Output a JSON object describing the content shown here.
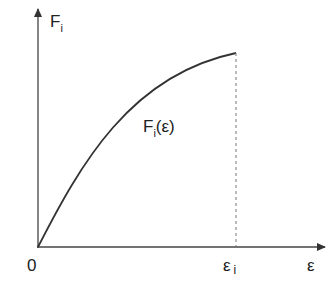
{
  "diagram": {
    "type": "force-strain curve",
    "y_axis_label": "F",
    "y_axis_sub": "i",
    "x_axis_label": "ε",
    "origin_label": "0",
    "x_marker_label": "ε",
    "x_marker_sub": "i",
    "curve_label_main": "F",
    "curve_label_sub": "i",
    "curve_label_arg": "(ε)",
    "colors": {
      "line": "#333333",
      "dashed": "#666666",
      "background": "#ffffff"
    }
  }
}
